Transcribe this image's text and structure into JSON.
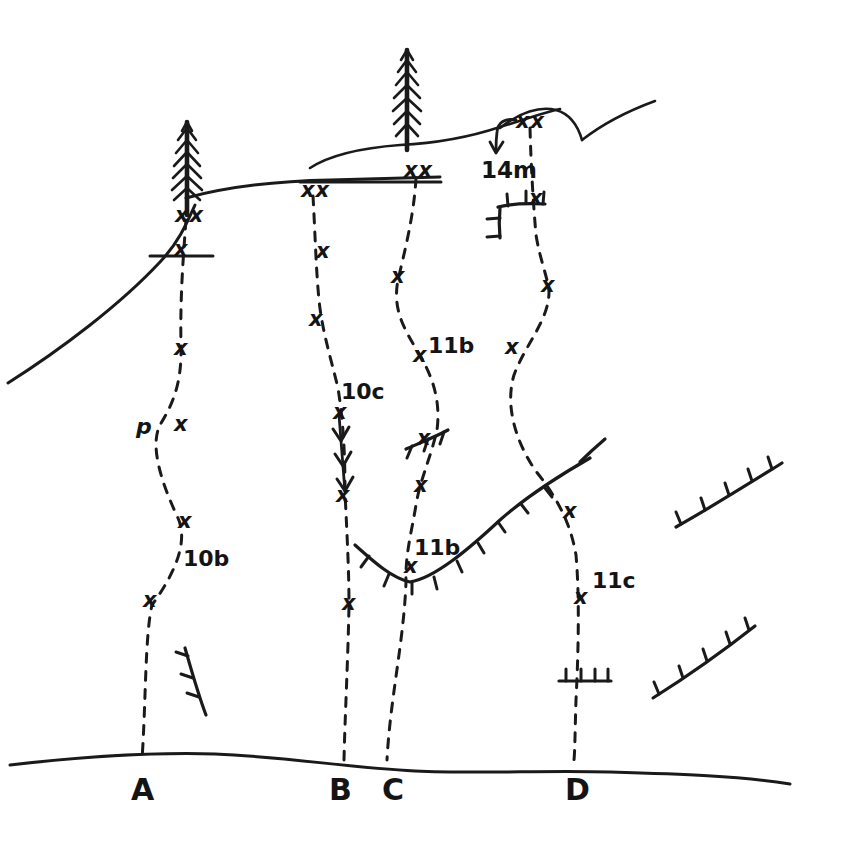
{
  "diagram": {
    "kind": "climbing-topo",
    "ink_color": "#1a1a1a",
    "paper_color": "#ffffff",
    "width": 855,
    "height": 857
  },
  "ground": {
    "label": "ground-line",
    "path": "M 10 765 C 80 757 150 752 215 754 C 290 757 350 768 415 771 C 480 774 545 770 610 772 C 680 774 740 776 790 784"
  },
  "skyline": {
    "left_ridge": {
      "name": "left-ridge",
      "path": "M 8 383 C 60 350 120 305 160 262 C 178 243 186 225 195 205"
    },
    "main_ridge": {
      "name": "main-ridge",
      "path": "M 186 198 C 230 186 280 181 330 180 C 370 179 405 178 440 177"
    },
    "mid_bulge": {
      "name": "mid-bulge",
      "path": "M 310 168 C 330 155 360 148 400 145 C 440 143 470 137 500 127 C 530 118 545 112 560 109"
    },
    "summit_arc": {
      "name": "summit-arc",
      "path": "M 500 128 C 520 112 540 106 556 110 C 570 114 578 126 582 140"
    },
    "right_ridge": {
      "name": "right-ridge",
      "path": "M 582 140 C 600 126 625 112 655 101"
    },
    "ledge_a": {
      "name": "belay-ledge-a",
      "path": "M 150 256 L 213 256"
    },
    "ledge_b": {
      "name": "belay-ledge-b",
      "path": "M 300 182 L 441 182"
    }
  },
  "trees": [
    {
      "name": "tree-left",
      "x": 187,
      "base_y": 215,
      "height": 95,
      "label": "conifer"
    },
    {
      "name": "tree-right",
      "x": 407,
      "base_y": 148,
      "height": 100,
      "label": "conifer"
    }
  ],
  "routes": [
    {
      "id": "A",
      "name": "route-a",
      "station_label": "A",
      "station_x": 140,
      "station_y": 793,
      "grade": "10b",
      "grade_x": 183,
      "grade_y": 559,
      "anchor": {
        "label": "xx",
        "x": 186,
        "y": 215
      },
      "style": "dashed",
      "path": "M 186 220 C 183 260 180 300 181 345 C 182 385 172 405 160 425 C 150 445 160 480 178 518 C 190 545 170 580 152 605 C 145 635 146 700 142 760",
      "bolts": [
        {
          "label": "x",
          "x": 181,
          "y": 249
        },
        {
          "label": "x",
          "x": 181,
          "y": 348
        },
        {
          "label": "x",
          "x": 181,
          "y": 424
        },
        {
          "label": "x",
          "x": 185,
          "y": 521
        },
        {
          "label": "x",
          "x": 150,
          "y": 600
        }
      ],
      "piton": {
        "label": "p",
        "x": 143,
        "y": 427
      }
    },
    {
      "id": "B",
      "name": "route-b",
      "station_label": "B",
      "station_x": 338,
      "station_y": 793,
      "grade": "10c",
      "grade_x": 341,
      "grade_y": 392,
      "anchor": {
        "label": "xx",
        "x": 312,
        "y": 190
      },
      "style": "dashed-with-arrows",
      "path": "M 313 196 C 315 230 316 270 319 300 C 322 330 330 355 338 388 C 343 420 345 450 345 492 C 347 535 349 570 349 605 C 348 660 345 715 344 760",
      "bolts": [
        {
          "label": "x",
          "x": 323,
          "y": 251
        },
        {
          "label": "x",
          "x": 316,
          "y": 319
        },
        {
          "label": "x",
          "x": 340,
          "y": 412
        },
        {
          "label": "x",
          "x": 343,
          "y": 495
        },
        {
          "label": "x",
          "x": 349,
          "y": 603
        }
      ],
      "arrow_segment": {
        "name": "direction-arrows",
        "path": "M 339 415 C 341 440 343 465 345 492",
        "chevrons": [
          {
            "x": 341,
            "y": 437
          },
          {
            "x": 343,
            "y": 462
          },
          {
            "x": 345,
            "y": 487
          }
        ]
      }
    },
    {
      "id": "C",
      "name": "route-c",
      "station_label": "C",
      "station_x": 391,
      "station_y": 793,
      "grades": [
        {
          "text": "11b",
          "x": 428,
          "y": 346
        },
        {
          "text": "11b",
          "x": 414,
          "y": 548
        }
      ],
      "anchor": {
        "label": "xx",
        "x": 415,
        "y": 170
      },
      "style": "dashed",
      "path": "M 416 178 C 414 215 405 250 398 280 C 392 310 405 330 418 352 C 432 375 441 400 437 430 C 430 460 420 480 416 505 C 412 530 405 555 406 582 C 404 640 390 700 387 760",
      "bolts": [
        {
          "label": "x",
          "x": 398,
          "y": 276
        },
        {
          "label": "x",
          "x": 420,
          "y": 355
        },
        {
          "label": "x",
          "x": 424,
          "y": 438
        },
        {
          "label": "x",
          "x": 421,
          "y": 485
        },
        {
          "label": "x",
          "x": 411,
          "y": 566
        }
      ]
    },
    {
      "id": "D",
      "name": "route-d",
      "station_label": "D",
      "station_x": 574,
      "station_y": 793,
      "grade": "11c",
      "grade_x": 592,
      "grade_y": 581,
      "anchor": {
        "label": "xx",
        "x": 528,
        "y": 121
      },
      "style": "dashed",
      "path": "M 530 128 C 531 165 533 200 536 235 C 540 260 548 278 549 292 C 549 320 525 345 514 375 C 505 405 515 440 535 470 C 555 495 570 520 576 555 C 580 600 578 660 576 700 C 575 730 575 750 574 760",
      "bolts": [
        {
          "label": "x",
          "x": 536,
          "y": 198
        },
        {
          "label": "x",
          "x": 548,
          "y": 285
        },
        {
          "label": "x",
          "x": 512,
          "y": 347
        },
        {
          "label": "x",
          "x": 570,
          "y": 511
        },
        {
          "label": "x",
          "x": 581,
          "y": 597
        }
      ]
    }
  ],
  "distance_note": {
    "name": "distance-annotation",
    "text": "14m",
    "x": 487,
    "y": 160,
    "arrow_path": "M 516 120 C 505 118 498 122 497 132 C 496 140 496 145 496 150",
    "arrow_tip": {
      "x": 496,
      "y": 152
    }
  },
  "roofs": [
    {
      "name": "roof-upper-right-corner",
      "path": "M 498 207 C 510 204 525 203 545 204",
      "vertical": "M 500 208 C 499 218 499 228 500 238",
      "ticks": [
        {
          "x1": 508,
          "y1": 206,
          "x2": 507,
          "y2": 194
        },
        {
          "x1": 526,
          "y1": 203,
          "x2": 526,
          "y2": 191
        },
        {
          "x1": 543,
          "y1": 204,
          "x2": 544,
          "y2": 192
        },
        {
          "x1": 500,
          "y1": 218,
          "x2": 487,
          "y2": 219
        },
        {
          "x1": 500,
          "y1": 236,
          "x2": 487,
          "y2": 237
        }
      ]
    },
    {
      "name": "roof-route-c-upper",
      "path": "M 406 449 C 420 443 435 437 448 430",
      "ticks": [
        {
          "x1": 412,
          "y1": 446,
          "x2": 407,
          "y2": 458
        },
        {
          "x1": 428,
          "y1": 439,
          "x2": 424,
          "y2": 451
        },
        {
          "x1": 444,
          "y1": 432,
          "x2": 440,
          "y2": 444
        }
      ]
    },
    {
      "name": "roof-main-valley",
      "path": "M 355 545 C 375 563 392 578 410 582 C 435 578 470 548 500 520 C 525 498 555 478 590 458",
      "ticks": [
        {
          "x1": 369,
          "y1": 556,
          "x2": 361,
          "y2": 567
        },
        {
          "x1": 389,
          "y1": 574,
          "x2": 384,
          "y2": 586
        },
        {
          "x1": 412,
          "y1": 582,
          "x2": 412,
          "y2": 594
        },
        {
          "x1": 434,
          "y1": 577,
          "x2": 437,
          "y2": 589
        },
        {
          "x1": 457,
          "y1": 561,
          "x2": 462,
          "y2": 572
        },
        {
          "x1": 478,
          "y1": 543,
          "x2": 484,
          "y2": 553
        },
        {
          "x1": 498,
          "y1": 522,
          "x2": 505,
          "y2": 532
        },
        {
          "x1": 521,
          "y1": 504,
          "x2": 528,
          "y2": 513
        },
        {
          "x1": 545,
          "y1": 488,
          "x2": 552,
          "y2": 497
        }
      ],
      "detached_tip": "M 580 462 C 590 452 598 445 605 439"
    },
    {
      "name": "roof-route-d-lower",
      "path": "M 559 681 C 578 681 596 681 611 681",
      "ticks": [
        {
          "x1": 566,
          "y1": 681,
          "x2": 566,
          "y2": 669
        },
        {
          "x1": 581,
          "y1": 681,
          "x2": 581,
          "y2": 669
        },
        {
          "x1": 595,
          "y1": 681,
          "x2": 595,
          "y2": 669
        },
        {
          "x1": 608,
          "y1": 681,
          "x2": 608,
          "y2": 669
        }
      ]
    },
    {
      "name": "roof-lower-left-steep",
      "path": "M 185 648 C 192 672 198 694 206 715",
      "ticks": [
        {
          "x1": 188,
          "y1": 656,
          "x2": 176,
          "y2": 652
        },
        {
          "x1": 193,
          "y1": 678,
          "x2": 181,
          "y2": 674
        },
        {
          "x1": 199,
          "y1": 697,
          "x2": 187,
          "y2": 693
        }
      ]
    },
    {
      "name": "roof-right-upper",
      "path": "M 676 527 C 710 508 745 486 782 463",
      "ticks": [
        {
          "x1": 681,
          "y1": 524,
          "x2": 676,
          "y2": 512
        },
        {
          "x1": 705,
          "y1": 510,
          "x2": 701,
          "y2": 498
        },
        {
          "x1": 729,
          "y1": 495,
          "x2": 725,
          "y2": 483
        },
        {
          "x1": 752,
          "y1": 481,
          "x2": 748,
          "y2": 469
        },
        {
          "x1": 772,
          "y1": 469,
          "x2": 768,
          "y2": 457
        }
      ]
    },
    {
      "name": "roof-right-lower",
      "path": "M 653 698 C 688 676 722 652 755 626",
      "ticks": [
        {
          "x1": 659,
          "y1": 694,
          "x2": 654,
          "y2": 682
        },
        {
          "x1": 683,
          "y1": 678,
          "x2": 679,
          "y2": 666
        },
        {
          "x1": 707,
          "y1": 661,
          "x2": 703,
          "y2": 649
        },
        {
          "x1": 730,
          "y1": 644,
          "x2": 726,
          "y2": 632
        },
        {
          "x1": 749,
          "y1": 630,
          "x2": 745,
          "y2": 618
        }
      ]
    }
  ],
  "legend_symbols": {
    "bolt": "x",
    "anchor": "xx",
    "piton": "p"
  }
}
